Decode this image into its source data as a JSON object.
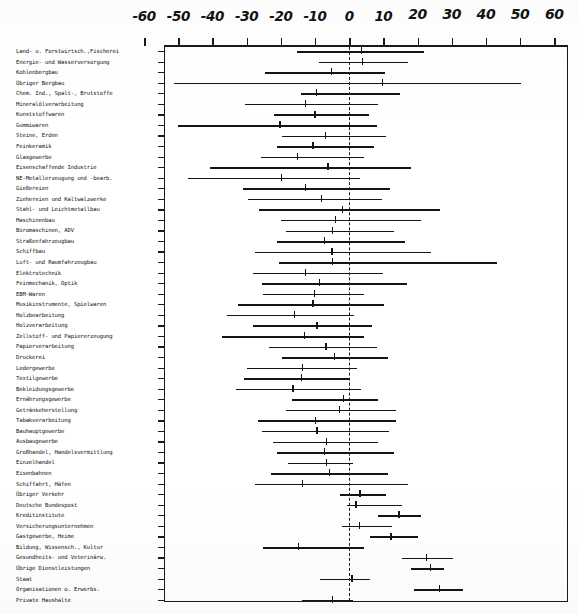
{
  "chart_data": {
    "type": "bar",
    "subtype": "range-interval-plot",
    "title": "",
    "xlabel": "",
    "ylabel": "",
    "xlim": [
      -65,
      65
    ],
    "xticks": [
      -60,
      -50,
      -40,
      -30,
      -20,
      -10,
      0,
      10,
      20,
      30,
      40,
      50,
      60
    ],
    "xtick_labels": [
      "-60",
      "-50",
      "-40",
      "-30",
      "-20",
      "-10",
      "0",
      "10",
      "20",
      "30",
      "40",
      "50",
      "60"
    ],
    "grid": false,
    "legend": false,
    "zero_reference_line": 0,
    "zero_line_style": "dashed",
    "categories": [
      "Land- u. Forstwirtsch.,Fischerei",
      "Energie- und Wasserversorgung",
      "Kohlenbergbau",
      "Übriger Bergbau",
      "Chem. Ind., Spalt-, Brutstoffe",
      "Mineralölverarbeitung",
      "Kunststoffwaren",
      "Gummiwaren",
      "Steine, Erden",
      "Feinkeramik",
      "Glasgewerbe",
      "Eisenschaffende Industrie",
      "NE-Metallerzeugung und -bearb.",
      "Gießereien",
      "Ziehereien und Kaltwalzwerke",
      "Stahl- und Leichtmetallbau",
      "Maschinenbau",
      "Büromaschinen, ADV",
      "Straßenfahrzeugbau",
      "Schiffbau",
      "Luft- und Raumfahrzeugbau",
      "Elektrotechnik",
      "Feinmechanik, Optik",
      "EBM-Waren",
      "Musikinstrumente, Spielwaren",
      "Holzbearbeitung",
      "Holzverarbeitung",
      "Zellstoff- und Papiererzeugung",
      "Papierverarbeitung",
      "Druckerei",
      "Ledergewerbe",
      "Textilgewerbe",
      "Bekleidungsgewerbe",
      "Ernährungsgewerbe",
      "Getränkeherstellung",
      "Tabakverarbeitung",
      "Bauhauptgewerbe",
      "Ausbaugewerbe",
      "Großhandel, Handelsvermittlung",
      "Einzelhandel",
      "Eisenbahnen",
      "Schiffahrt, Häfen",
      "Übriger Verkehr",
      "Deutsche Bundespost",
      "Kreditinstitute",
      "Versicherungsunternehmen",
      "Gastgewerbe, Heime",
      "Bildung, Wissensch., Kultur",
      "Gesundheits- und Veterinärw.",
      "Übrige Dienstleistungen",
      "Staat",
      "Organisationen o. Erwerbs.",
      "Private Haushalte"
    ],
    "series": [
      {
        "name": "range_low",
        "values": [
          -15.2,
          -8.8,
          -24.6,
          -51.2,
          -14.0,
          -30.5,
          -22.0,
          -50.0,
          -19.8,
          -21.0,
          -25.8,
          -40.6,
          -47.2,
          -31.0,
          -29.5,
          -26.3,
          -20.0,
          -18.5,
          -21.0,
          -27.6,
          -20.4,
          -28.0,
          -25.5,
          -25.2,
          -32.5,
          -35.8,
          -28.0,
          -37.2,
          -23.4,
          -19.8,
          -29.8,
          -30.8,
          -33.0,
          -16.6,
          -18.6,
          -26.6,
          -25.5,
          -22.4,
          -21.0,
          -18.0,
          -23.0,
          -27.6,
          -2.6,
          -0.6,
          8.4,
          -2.2,
          6.0,
          -25.2,
          15.4,
          18.0,
          -8.4,
          19.0,
          -13.8
        ]
      },
      {
        "name": "range_high",
        "values": [
          22.0,
          17.2,
          10.6,
          50.4,
          15.0,
          8.4,
          5.8,
          8.0,
          10.8,
          7.4,
          4.4,
          18.2,
          3.2,
          12.0,
          9.6,
          26.6,
          21.0,
          13.0,
          16.2,
          24.0,
          43.2,
          10.0,
          17.0,
          4.2,
          10.2,
          1.4,
          6.8,
          4.2,
          8.2,
          11.4,
          2.2,
          0.2,
          3.6,
          8.4,
          13.8,
          13.8,
          11.6,
          8.4,
          13.2,
          1.0,
          11.4,
          17.2,
          10.8,
          15.4,
          21.0,
          12.4,
          20.0,
          4.4,
          30.4,
          27.6,
          6.0,
          33.4,
          1.0
        ]
      },
      {
        "name": "point_estimate",
        "values": [
          3.4,
          3.8,
          -5.4,
          9.6,
          -9.8,
          -13.0,
          -10.2,
          -20.4,
          -7.2,
          -10.8,
          -15.4,
          -6.4,
          -20.0,
          -13.0,
          -8.2,
          -2.2,
          -4.2,
          -5.0,
          -7.4,
          -5.2,
          -5.0,
          -13.0,
          -8.8,
          -10.4,
          -10.8,
          -16.2,
          -9.6,
          -13.2,
          -7.0,
          -4.4,
          -13.8,
          -14.2,
          -16.6,
          -1.8,
          -3.0,
          -10.0,
          -9.6,
          -6.8,
          -7.4,
          -6.8,
          -6.0,
          -13.8,
          3.0,
          1.8,
          14.4,
          2.8,
          12.0,
          -15.0,
          22.4,
          23.6,
          0.6,
          26.2,
          -5.0
        ]
      }
    ]
  },
  "axis": {
    "tick_labels": [
      "-60",
      "-50",
      "-40",
      "-30",
      "-20",
      "-10",
      "0",
      "10",
      "20",
      "30",
      "40",
      "50",
      "60"
    ]
  }
}
